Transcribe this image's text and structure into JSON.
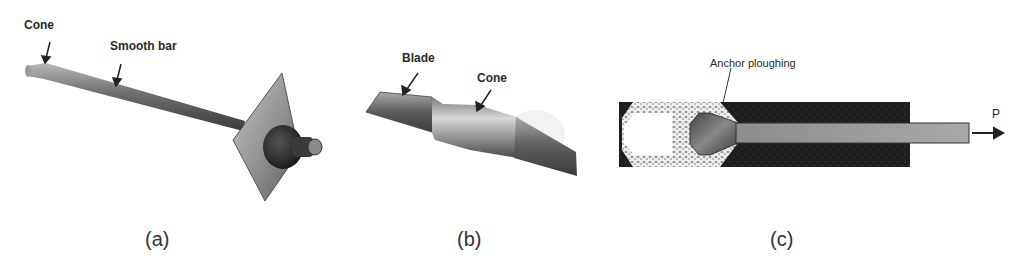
{
  "figure": {
    "panels": [
      {
        "id": "a",
        "caption": "(a)",
        "type": "photo",
        "description": "Cone anchor bolt with smooth bar, face plate and nut",
        "annotations": [
          {
            "text": "Cone"
          },
          {
            "text": "Smooth bar"
          }
        ]
      },
      {
        "id": "b",
        "caption": "(b)",
        "type": "photo",
        "description": "Close-up of anchor end showing blade and cone",
        "annotations": [
          {
            "text": "Blade"
          },
          {
            "text": "Cone"
          }
        ]
      },
      {
        "id": "c",
        "caption": "(c)",
        "type": "schematic",
        "description": "Cross-section of cone anchor ploughing through grout under pull load P",
        "annotations": [
          {
            "text": "Anchor ploughing"
          },
          {
            "text": "P"
          }
        ]
      }
    ],
    "colors": {
      "background": "#ffffff",
      "rock": "#1e1e1e",
      "grout_crushed": "#e8e8e8",
      "rod": "#9a9a9a",
      "text": "#2a2a2a"
    }
  }
}
